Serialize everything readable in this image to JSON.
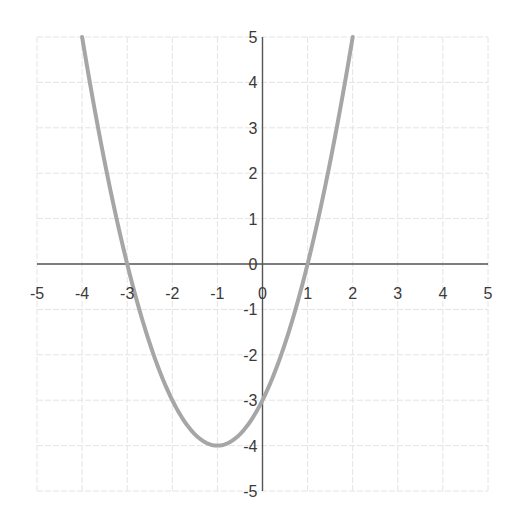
{
  "chart_data": {
    "type": "line",
    "title": "",
    "xlabel": "",
    "ylabel": "",
    "function": "y = x^2 + 2x - 3",
    "xlim": [
      -5,
      5
    ],
    "ylim": [
      -5,
      5
    ],
    "grid": true,
    "legend": null,
    "x_ticks": [
      -5,
      -4,
      -3,
      -2,
      -1,
      0,
      1,
      2,
      3,
      4,
      5
    ],
    "y_ticks": [
      -5,
      -4,
      -3,
      -2,
      -1,
      0,
      1,
      2,
      3,
      4,
      5
    ],
    "series": [
      {
        "name": "parabola",
        "color": "#a6a6a6",
        "x": [
          -4,
          -3.5,
          -3,
          -2.5,
          -2,
          -1.5,
          -1,
          -0.5,
          0,
          0.5,
          1,
          1.5,
          2
        ],
        "y": [
          5,
          2.25,
          0,
          -1.75,
          -3,
          -3.75,
          -4,
          -3.75,
          -3,
          -1.75,
          0,
          2.25,
          5
        ]
      }
    ],
    "key_points": {
      "roots": [
        -3,
        1
      ],
      "vertex": [
        -1,
        -4
      ],
      "y_intercept": -3
    }
  },
  "colors": {
    "grid": "#e4e4e4",
    "axis": "#555555",
    "curve": "#a6a6a6",
    "labels": "#3a3a3a"
  }
}
